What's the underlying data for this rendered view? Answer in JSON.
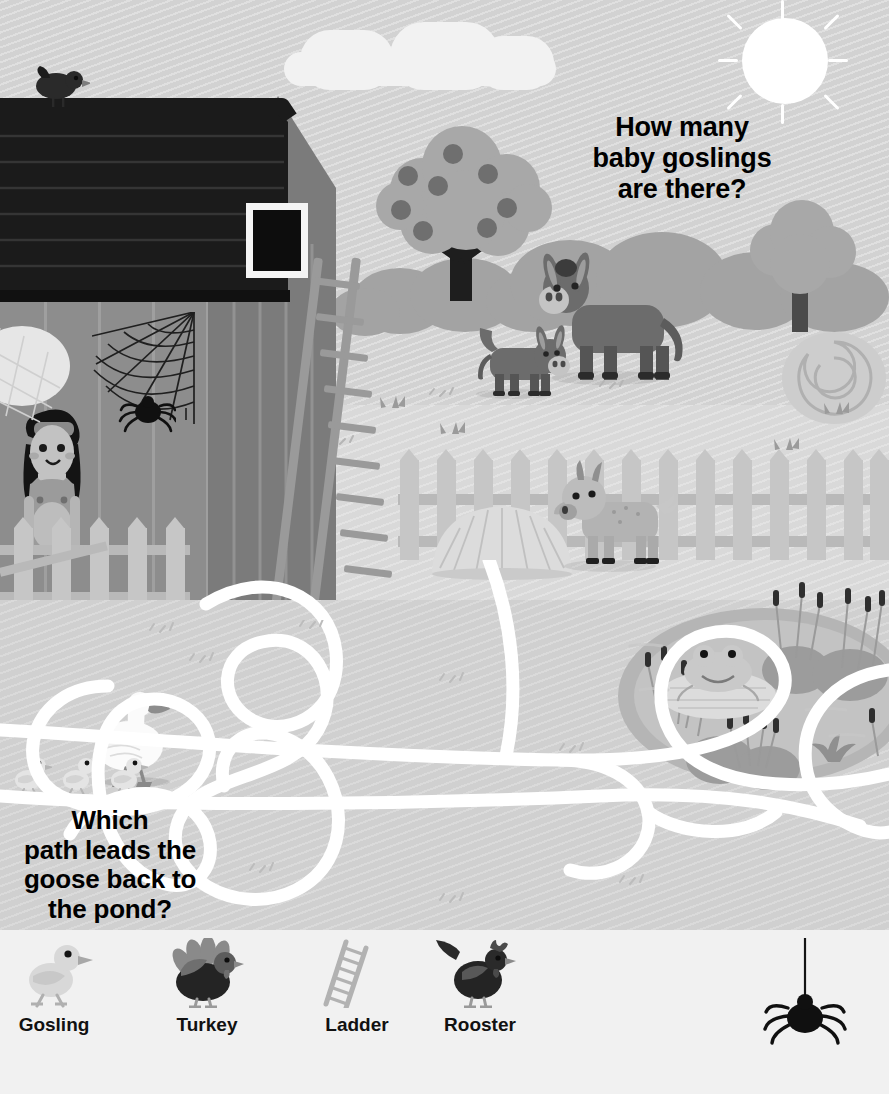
{
  "page": {
    "width": 889,
    "height": 1094,
    "colors": {
      "sky": "#d2d2d2",
      "ground": "#d9d9d9",
      "ground_lower": "#d0d0d0",
      "barn_wall": "#8d8d8d",
      "barn_front": "#7b7b7b",
      "roof": "#1b1b1b",
      "fence": "#c6c6c6",
      "pond": "#b5b5b5",
      "maze_path": "#ffffff",
      "legend_bar": "#f1f1f1",
      "text": "#000000"
    }
  },
  "questions": {
    "goslings": "How many baby goslings are there?",
    "goslings_lines": [
      "How many",
      "baby goslings",
      "are there?"
    ],
    "path": "Which path leads the goose back to the pond?",
    "path_lines": [
      "Which",
      "path leads the",
      "goose back to",
      "the pond?"
    ],
    "spider": "Can you spot the spider?",
    "spider_lines": [
      "Can you spot",
      "the spider?"
    ]
  },
  "legend": {
    "items": [
      {
        "label": "Gosling",
        "icon": "gosling-icon"
      },
      {
        "label": "Turkey",
        "icon": "turkey-icon"
      },
      {
        "label": "Ladder",
        "icon": "ladder-icon"
      },
      {
        "label": "Rooster",
        "icon": "rooster-icon"
      }
    ]
  },
  "scene": {
    "sky": {
      "sun": "sun-icon",
      "sun_rays": 8,
      "clouds": 1
    },
    "barn": {
      "name": "red-barn",
      "roof": "shingled-roof",
      "window": "hay-loft-window",
      "ladder": "leaning-ladder",
      "cobweb": "spider-web",
      "spider": "hanging-spider",
      "bird_on_roof": "crow-icon"
    },
    "tree": {
      "name": "apple-tree",
      "apples": 8
    },
    "tree_right": {
      "name": "bare-tree"
    },
    "animals": [
      {
        "name": "donkey-adult",
        "count": 1
      },
      {
        "name": "donkey-foal",
        "count": 1
      },
      {
        "name": "goat",
        "count": 1
      },
      {
        "name": "goose",
        "count": 1
      },
      {
        "name": "gosling",
        "count": 3
      },
      {
        "name": "frog",
        "count": 1
      },
      {
        "name": "crow",
        "count": 1
      }
    ],
    "objects": [
      {
        "name": "hay-bale-round"
      },
      {
        "name": "haystack"
      },
      {
        "name": "picket-fence"
      },
      {
        "name": "farm-gate"
      },
      {
        "name": "pond"
      },
      {
        "name": "lily-pad"
      },
      {
        "name": "cattails"
      }
    ],
    "character": {
      "name": "farmer-girl",
      "outfit": "overalls-and-cap"
    }
  }
}
